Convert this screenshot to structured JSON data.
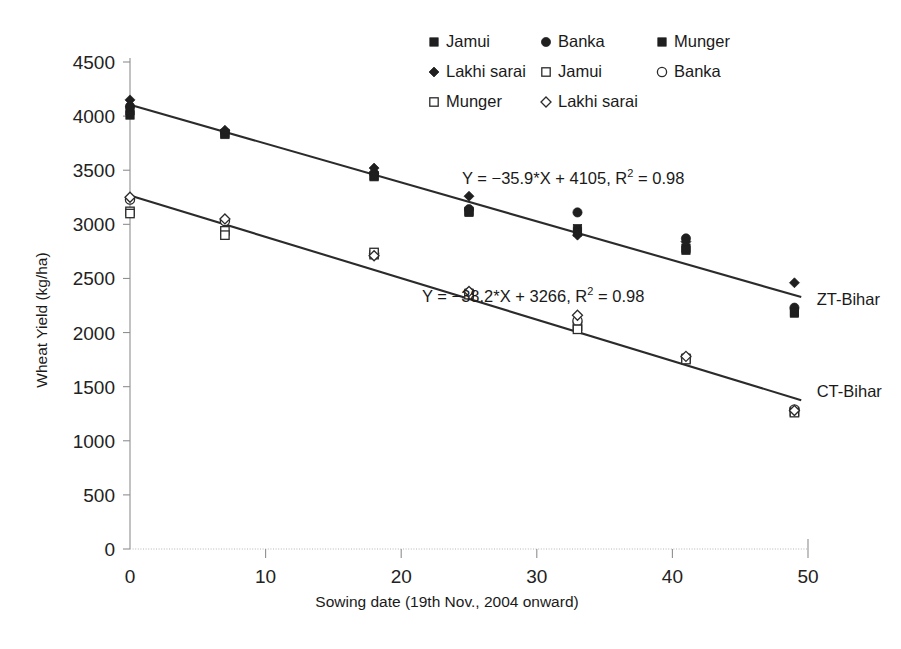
{
  "chart_data": {
    "type": "scatter",
    "title": "",
    "xlabel": "Sowing date (19th Nov., 2004 onward)",
    "ylabel": "Wheat Yield (kg/ha)",
    "xlim": [
      0,
      50
    ],
    "ylim": [
      0,
      4500
    ],
    "xticks": [
      0,
      10,
      20,
      30,
      40,
      50
    ],
    "yticks": [
      0,
      500,
      1000,
      1500,
      2000,
      2500,
      3000,
      3500,
      4000,
      4500
    ],
    "grid": false,
    "legend_position": "top-center",
    "legend": [
      {
        "label": "Jamui",
        "marker": "filled-square",
        "group": "ZT-Bihar"
      },
      {
        "label": "Banka",
        "marker": "filled-circle",
        "group": "ZT-Bihar"
      },
      {
        "label": "Munger",
        "marker": "filled-square",
        "group": "ZT-Bihar"
      },
      {
        "label": "Lakhi sarai",
        "marker": "filled-diamond",
        "group": "ZT-Bihar"
      },
      {
        "label": "Jamui",
        "marker": "open-square",
        "group": "CT-Bihar"
      },
      {
        "label": "Banka",
        "marker": "open-circle",
        "group": "CT-Bihar"
      },
      {
        "label": "Munger",
        "marker": "open-square",
        "group": "CT-Bihar"
      },
      {
        "label": "Lakhi sarai",
        "marker": "open-diamond",
        "group": "CT-Bihar"
      }
    ],
    "series": [
      {
        "name": "Jamui",
        "group": "ZT-Bihar",
        "marker": "filled-square",
        "x": [
          0,
          7,
          18,
          25,
          33,
          41,
          49
        ],
        "values": [
          4050,
          3840,
          3450,
          3120,
          2930,
          2780,
          2190
        ]
      },
      {
        "name": "Banka",
        "group": "ZT-Bihar",
        "marker": "filled-circle",
        "x": [
          0,
          7,
          18,
          25,
          33,
          41,
          49
        ],
        "values": [
          4090,
          3850,
          3470,
          3140,
          3110,
          2870,
          2230
        ]
      },
      {
        "name": "Munger",
        "group": "ZT-Bihar",
        "marker": "filled-square",
        "x": [
          0,
          7,
          18,
          25,
          33,
          41,
          49
        ],
        "values": [
          4010,
          3830,
          3440,
          3110,
          2960,
          2760,
          2180
        ]
      },
      {
        "name": "Lakhi sarai",
        "group": "ZT-Bihar",
        "marker": "filled-diamond",
        "x": [
          0,
          7,
          18,
          25,
          33,
          41,
          49
        ],
        "values": [
          4150,
          3870,
          3520,
          3260,
          2900,
          2840,
          2460
        ]
      },
      {
        "name": "Jamui",
        "group": "CT-Bihar",
        "marker": "open-square",
        "x": [
          0,
          7,
          18,
          25,
          33,
          41,
          49
        ],
        "values": [
          3120,
          2940,
          2720,
          2360,
          2060,
          1760,
          1270
        ]
      },
      {
        "name": "Banka",
        "group": "CT-Bihar",
        "marker": "open-circle",
        "x": [
          0,
          7,
          18,
          25,
          33,
          41,
          49
        ],
        "values": [
          3230,
          3030,
          2730,
          2370,
          2110,
          1770,
          1290
        ]
      },
      {
        "name": "Munger",
        "group": "CT-Bihar",
        "marker": "open-square",
        "x": [
          0,
          7,
          18,
          25,
          33,
          41,
          49
        ],
        "values": [
          3100,
          2900,
          2740,
          2350,
          2030,
          1750,
          1260
        ]
      },
      {
        "name": "Lakhi sarai",
        "group": "CT-Bihar",
        "marker": "open-diamond",
        "x": [
          0,
          7,
          18,
          25,
          33,
          41,
          49
        ],
        "values": [
          3250,
          3050,
          2710,
          2380,
          2160,
          1780,
          1280
        ]
      }
    ],
    "trendlines": [
      {
        "name": "ZT-Bihar",
        "slope": -35.9,
        "intercept": 4105,
        "r_squared": 0.98,
        "equation": "Y = −35.9*X + 4105, R",
        "equation_sup": "2",
        "equation_tail": " = 0.98",
        "x_from": 0,
        "x_to": 49.5
      },
      {
        "name": "CT-Bihar",
        "slope": -38.2,
        "intercept": 3266,
        "r_squared": 0.98,
        "equation": "Y = −38.2*X + 3266, R",
        "equation_sup": "2",
        "equation_tail": " = 0.98",
        "x_from": 0,
        "x_to": 49.5
      }
    ],
    "series_labels": [
      {
        "text": "ZT-Bihar",
        "x": 50.2,
        "y": 2310
      },
      {
        "text": "CT-Bihar",
        "x": 50.2,
        "y": 1460
      }
    ],
    "annotations": [
      {
        "id": "zt-eq",
        "px": 462,
        "py": 184
      },
      {
        "id": "ct-eq",
        "px": 422,
        "py": 302
      }
    ]
  }
}
